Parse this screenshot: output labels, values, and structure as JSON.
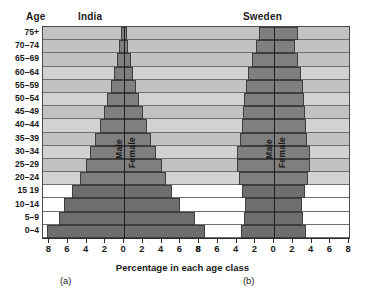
{
  "labels": {
    "age_header": "Age",
    "x_axis_label": "Percentage in each age class",
    "caption_a": "(a)",
    "caption_b": "(b)",
    "male": "Male",
    "female": "Female"
  },
  "colors": {
    "bar_fill": "#807f7f",
    "bar_fill_dark": "#6f6e6e",
    "bar_outline": "#3e3e3e",
    "band_light": "#d2d2d2",
    "band_mid": "#c2c2c2",
    "band_low": "#ffffff",
    "axis": "#1f1f1f",
    "text": "#1a1a1a"
  },
  "chart_data": {
    "type": "bar",
    "subtitle": "",
    "xlabel": "Percentage in each age class",
    "ylabel": "Age",
    "xlim": [
      -8,
      8
    ],
    "grid": true,
    "legend": [
      "Male",
      "Female"
    ],
    "legend_position": "in-plot-vertical",
    "orientation": "horizontal-diverging",
    "x_ticks": [
      8,
      6,
      4,
      2,
      0,
      2,
      4,
      6,
      8
    ],
    "x_tick_values": [
      -8,
      -6,
      -4,
      -2,
      0,
      2,
      4,
      6,
      8
    ],
    "categories": [
      "0–4",
      "5–9",
      "10–14",
      "15 19",
      "20–24",
      "25–29",
      "30–34",
      "35–39",
      "40–44",
      "45–49",
      "50–54",
      "55–59",
      "60–64",
      "65–69",
      "70–74",
      "75+"
    ],
    "panels": [
      {
        "name": "India",
        "caption": "(a)",
        "series": [
          {
            "name": "Male",
            "values": [
              8.2,
              7.0,
              6.4,
              5.6,
              4.7,
              4.1,
              3.6,
              3.1,
              2.6,
              2.2,
              1.8,
              1.4,
              1.1,
              0.8,
              0.5,
              0.35
            ]
          },
          {
            "name": "Female",
            "values": [
              8.6,
              7.6,
              6.0,
              5.1,
              4.5,
              4.0,
              3.4,
              2.9,
              2.4,
              2.0,
              1.6,
              1.3,
              1.0,
              0.7,
              0.45,
              0.3
            ]
          }
        ]
      },
      {
        "name": "Sweden",
        "caption": "(b)",
        "series": [
          {
            "name": "Male",
            "values": [
              3.5,
              3.2,
              3.1,
              3.4,
              3.7,
              3.9,
              3.9,
              3.6,
              3.4,
              3.3,
              3.2,
              3.0,
              2.8,
              2.4,
              1.9,
              1.6
            ]
          },
          {
            "name": "Female",
            "values": [
              3.4,
              3.1,
              3.0,
              3.3,
              3.6,
              3.8,
              3.8,
              3.5,
              3.4,
              3.3,
              3.2,
              3.1,
              2.9,
              2.6,
              2.2,
              2.6
            ]
          }
        ]
      }
    ]
  }
}
